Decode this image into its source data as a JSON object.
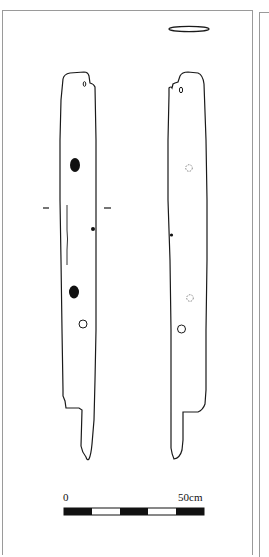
{
  "figure": {
    "type": "archaeological plank drawing",
    "views": [
      {
        "name": "face-a",
        "features": [
          "peg-hole-top",
          "filled-hole-upper",
          "filled-hole-lower",
          "nail-dot",
          "open-hole",
          "section-line",
          "crack-line"
        ]
      },
      {
        "name": "face-b",
        "features": [
          "peg-hole-top",
          "dashed-hole-upper",
          "dashed-hole-lower",
          "nail-dot",
          "open-hole"
        ]
      }
    ],
    "section_profile": "end-section-ellipse"
  },
  "scale_bar": {
    "start_label": "0",
    "end_label": "50cm",
    "segments": [
      "black",
      "white",
      "black",
      "white",
      "black"
    ],
    "colors": {
      "dark": "#111111",
      "light": "#ffffff"
    }
  },
  "colors": {
    "outline": "#1a1a1a",
    "frame": "#9a9a9a",
    "dashed": "#777777"
  }
}
